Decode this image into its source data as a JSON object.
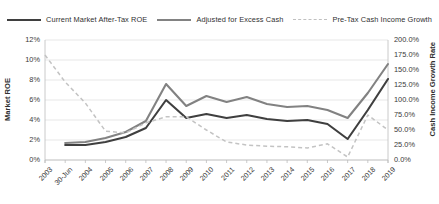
{
  "legend": {
    "items": [
      {
        "label": "Current Market After-Tax ROE",
        "style": "solid",
        "color": "#3f3f3f",
        "axis": "left"
      },
      {
        "label": "Adjusted for Excess Cash",
        "style": "solid",
        "color": "#828282",
        "axis": "left"
      },
      {
        "label": "Pre-Tax Cash Income Growth",
        "style": "dashed",
        "color": "#c3c3c3",
        "axis": "right"
      }
    ]
  },
  "axes": {
    "left": {
      "title": "Market ROE",
      "ticks": [
        "0%",
        "2%",
        "4%",
        "6%",
        "8%",
        "10%",
        "12%"
      ],
      "min": 0,
      "max": 12,
      "step": 2
    },
    "right": {
      "title": "Cash Income Growth Rate",
      "ticks": [
        "0.0%",
        "25.0%",
        "50.0%",
        "75.0%",
        "100.0%",
        "125.0%",
        "150.0%",
        "175.0%",
        "200.0%"
      ],
      "min": 0,
      "max": 200,
      "step": 25
    },
    "x": {
      "ticks": [
        "2003",
        "30-Jun",
        "2004",
        "2005",
        "2006",
        "2007",
        "2008",
        "2009",
        "2010",
        "2011",
        "2012",
        "2013",
        "2014",
        "2015",
        "2016",
        "2017",
        "2018",
        "2019"
      ]
    }
  },
  "chart_data": {
    "type": "line",
    "title": "",
    "xlabel": "",
    "ylabel": "Market ROE",
    "y2label": "Cash Income Growth Rate",
    "ylim": [
      0,
      12
    ],
    "y2lim": [
      0,
      200
    ],
    "grid": true,
    "legend_position": "top",
    "categories": [
      "2003",
      "30-Jun",
      "2004",
      "2005",
      "2006",
      "2007",
      "2008",
      "2009",
      "2010",
      "2011",
      "2012",
      "2013",
      "2014",
      "2015",
      "2016",
      "2017",
      "2018",
      "2019"
    ],
    "series": [
      {
        "name": "Current Market After-Tax ROE",
        "axis": "left",
        "unit": "%",
        "style": "solid",
        "color": "#3f3f3f",
        "values": [
          null,
          1.5,
          1.5,
          1.8,
          2.3,
          3.2,
          6.0,
          4.2,
          4.6,
          4.2,
          4.5,
          4.1,
          3.9,
          4.0,
          3.6,
          2.1,
          5.0,
          8.1
        ]
      },
      {
        "name": "Adjusted for Excess Cash",
        "axis": "left",
        "unit": "%",
        "style": "solid",
        "color": "#828282",
        "values": [
          null,
          1.7,
          1.8,
          2.2,
          2.8,
          3.9,
          7.6,
          5.4,
          6.4,
          5.8,
          6.3,
          5.6,
          5.3,
          5.4,
          5.0,
          4.2,
          6.7,
          9.6
        ]
      },
      {
        "name": "Pre-Tax Cash Income Growth",
        "axis": "right",
        "unit": "%",
        "style": "dashed",
        "color": "#c3c3c3",
        "values": [
          175.0,
          130.0,
          95.0,
          48.0,
          45.0,
          62.0,
          72.0,
          72.0,
          50.0,
          30.0,
          25.0,
          23.0,
          22.0,
          20.0,
          27.0,
          5.0,
          75.0,
          50.0
        ]
      }
    ]
  }
}
